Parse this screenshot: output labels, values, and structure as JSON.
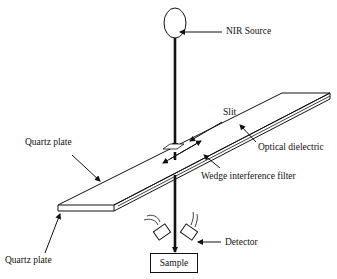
{
  "diagram": {
    "type": "schematic",
    "labels": {
      "nir_source": "NIR Source",
      "slit": "Slit",
      "quartz_plate_top": "Quartz plate",
      "optical_dielectric": "Optical dielectric",
      "wedge_filter": "Wedge interference filter",
      "quartz_plate_bottom": "Quartz plate",
      "detector": "Detector",
      "sample": "Sample"
    },
    "colors": {
      "line": "#111111",
      "background": "#ffffff"
    }
  }
}
